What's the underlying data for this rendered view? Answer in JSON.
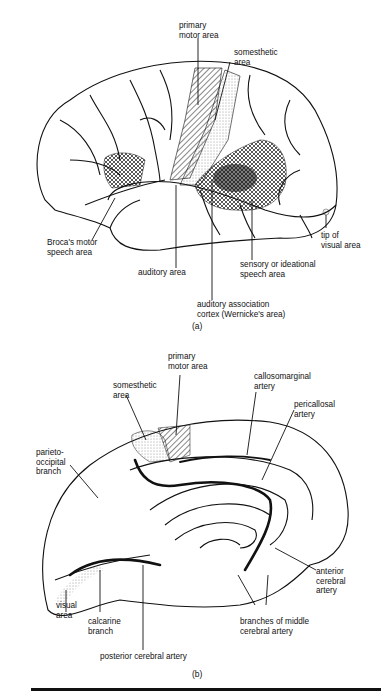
{
  "figure_a": {
    "caption": "(a)",
    "view": "lateral surface of cerebral hemisphere",
    "labels": {
      "primary_motor": "primary\nmotor area",
      "somesthetic": "somesthetic\narea",
      "broca": "Broca's motor\nspeech area",
      "auditory": "auditory area",
      "wernicke": "auditory association\ncortex (Wernicke's area)",
      "sensory_speech": "sensory or ideational\nspeech area",
      "visual_tip": "tip of\nvisual area"
    }
  },
  "figure_b": {
    "caption": "(b)",
    "view": "medial surface of cerebral hemisphere",
    "labels": {
      "primary_motor": "primary\nmotor area",
      "somesthetic": "somesthetic\narea",
      "callosomarginal": "callosomarginal\nartery",
      "pericallosal": "pericallosal\nartery",
      "parieto_occipital": "parieto-\noccipital\nbranch",
      "visual": "visual\narea",
      "calcarine": "calcarine\nbranch",
      "posterior_cerebral": "posterior cerebral artery",
      "middle_cerebral": "branches of middle\ncerebral artery",
      "anterior_cerebral": "anterior\ncerebral\nartery"
    }
  },
  "colors": {
    "ink": "#111111",
    "paper": "#ffffff"
  }
}
